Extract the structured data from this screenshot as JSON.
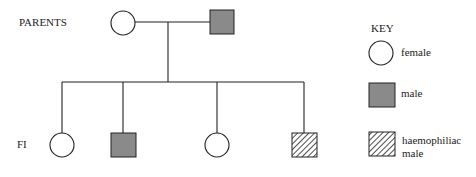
{
  "diagram": {
    "type": "pedigree",
    "generations": [
      {
        "label": "PARENTS",
        "members": [
          {
            "id": "p1",
            "sex": "female",
            "status": "unaffected"
          },
          {
            "id": "p2",
            "sex": "male",
            "status": "male"
          }
        ]
      },
      {
        "label": "F1",
        "members": [
          {
            "id": "c1",
            "sex": "female",
            "status": "unaffected"
          },
          {
            "id": "c2",
            "sex": "male",
            "status": "male"
          },
          {
            "id": "c3",
            "sex": "female",
            "status": "unaffected"
          },
          {
            "id": "c4",
            "sex": "male",
            "status": "haemophiliac"
          }
        ]
      }
    ]
  },
  "labels": {
    "parents": "PARENTS",
    "f1": "FI"
  },
  "key": {
    "title": "KEY",
    "items": [
      {
        "symbol": "circle",
        "label": "female"
      },
      {
        "symbol": "grey-square",
        "label": "male"
      },
      {
        "symbol": "hatched-square",
        "label_line1": "haemophiliac",
        "label_line2": "male"
      }
    ]
  },
  "colors": {
    "line": "#222222",
    "male_fill": "#8a8a8a",
    "background": "#ffffff"
  }
}
